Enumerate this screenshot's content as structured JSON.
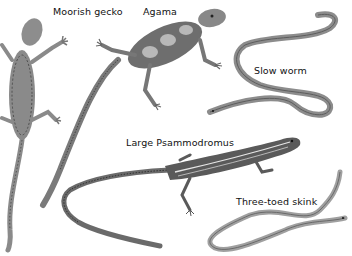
{
  "illustration": {
    "subject": "Reptiles",
    "labels": [
      {
        "id": "moorish-gecko",
        "text": "Moorish gecko",
        "x": 53,
        "y": 6
      },
      {
        "id": "agama",
        "text": "Agama",
        "x": 143,
        "y": 6
      },
      {
        "id": "slow-worm",
        "text": "Slow worm",
        "x": 254,
        "y": 65
      },
      {
        "id": "large-psammodromus",
        "text": "Large Psammodromus",
        "x": 126,
        "y": 137
      },
      {
        "id": "three-toed-skink",
        "text": "Three-toed skink",
        "x": 236,
        "y": 196
      }
    ],
    "colors": {
      "background": "#ffffff",
      "gecko": "#7a7a7a",
      "agama_body": "#6e6e6e",
      "agama_spots": "#b8b8b8",
      "slow_worm": "#8c8c8c",
      "psammodromus": "#5a5a5a",
      "skink": "#a0a0a0"
    }
  }
}
